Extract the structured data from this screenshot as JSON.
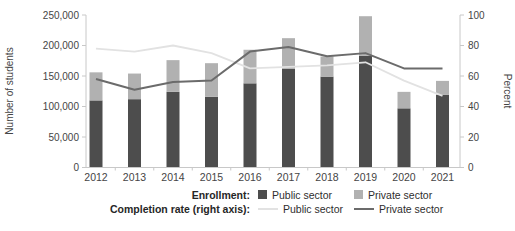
{
  "chart_data": {
    "type": "bar",
    "subtype": "stacked-bar-with-lines",
    "categories": [
      "2012",
      "2013",
      "2014",
      "2015",
      "2016",
      "2017",
      "2018",
      "2019",
      "2020",
      "2021"
    ],
    "bar_series": [
      {
        "name": "Public sector",
        "group": "Enrollment",
        "axis": "left",
        "color": "#4d4d4d",
        "values": [
          110000,
          112000,
          124000,
          116000,
          138000,
          162000,
          149000,
          183000,
          97000,
          119000
        ]
      },
      {
        "name": "Private sector",
        "group": "Enrollment",
        "axis": "left",
        "color": "#b1b1b1",
        "values": [
          46000,
          42000,
          52000,
          55000,
          55000,
          50000,
          33000,
          65000,
          27000,
          23000
        ]
      }
    ],
    "line_series": [
      {
        "name": "Public sector",
        "group": "Completion rate (right axis)",
        "axis": "right",
        "color": "#e2e2e2",
        "values": [
          78,
          76,
          80,
          75,
          65,
          66,
          67,
          69,
          57,
          47
        ]
      },
      {
        "name": "Private sector",
        "group": "Completion rate (right axis)",
        "axis": "right",
        "color": "#6b6b6b",
        "values": [
          58,
          51,
          56,
          57,
          76,
          79,
          73,
          75,
          65,
          65
        ]
      }
    ],
    "left_axis": {
      "label": "Number of students",
      "min": 0,
      "max": 250000,
      "step": 50000,
      "tick_labels": [
        "0",
        "50,000",
        "100,000",
        "150,000",
        "200,000",
        "250,000"
      ]
    },
    "right_axis": {
      "label": "Percent",
      "min": 0,
      "max": 100,
      "step": 20,
      "tick_labels": [
        "0",
        "20",
        "40",
        "60",
        "80",
        "100"
      ]
    },
    "grid": "off",
    "legend": {
      "position": "bottom",
      "enrollment_label": "Enrollment:",
      "completion_label": "Completion rate (right axis):",
      "bar_public": "Public sector",
      "bar_private": "Private sector",
      "line_public": "Public sector",
      "line_private": "Private sector"
    },
    "style": {
      "axis_line_color": "#c8c8c8",
      "tick_text_color": "#454545",
      "axis_title_color": "#454545",
      "background": "#ffffff"
    }
  }
}
